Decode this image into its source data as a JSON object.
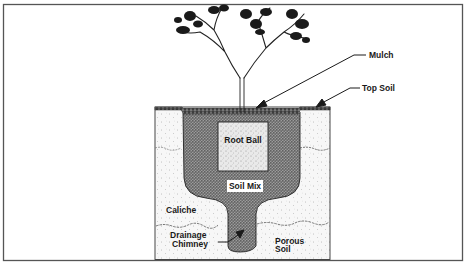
{
  "figure": {
    "type": "cross-section diagram",
    "colors": {
      "frame": "#555555",
      "ink": "#1a1a1a",
      "soil_mix": "#6b6b6b",
      "root_ball": "#e4e4e4",
      "native_soil": "#f6f6f6",
      "background": "#ffffff"
    }
  },
  "labels": {
    "mulch": "Mulch",
    "top_soil": "Top Soil",
    "root_ball": "Root Ball",
    "soil_mix": "Soil Mix",
    "caliche": "Caliche",
    "drainage_chimney_line1": "Drainage",
    "drainage_chimney_line2": "Chimney",
    "porous_soil_line1": "Porous",
    "porous_soil_line2": "Soil"
  }
}
